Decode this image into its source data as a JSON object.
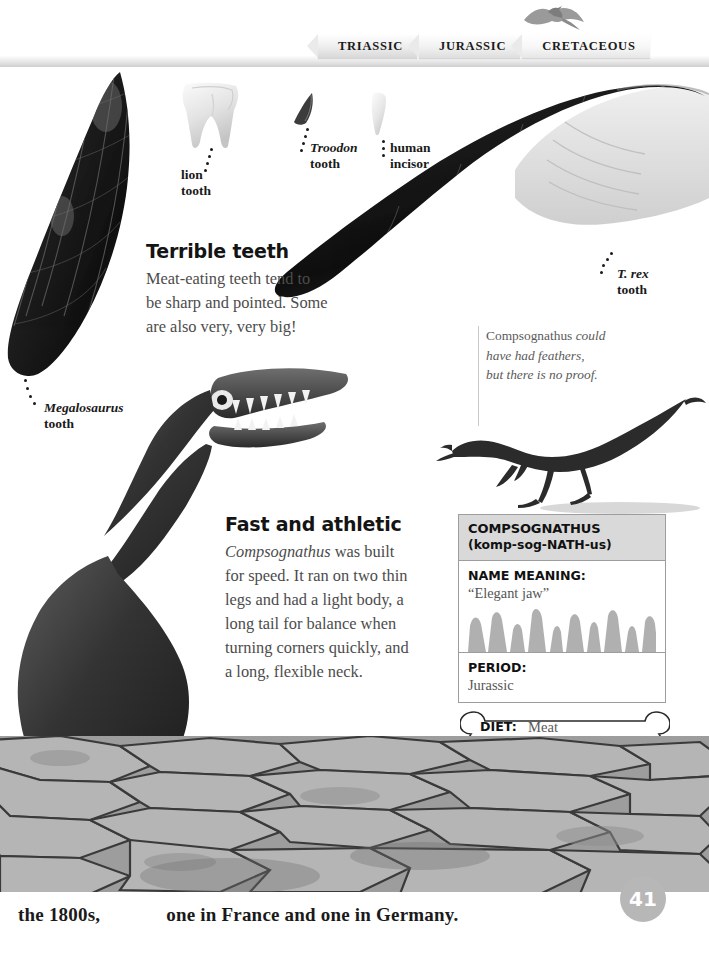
{
  "page": {
    "number": "41",
    "timeline": [
      {
        "label": "TRIASSIC"
      },
      {
        "label": "JURASSIC"
      },
      {
        "label": "CRETACEOUS"
      }
    ]
  },
  "specimen_labels": {
    "lion": "lion\ntooth",
    "lion_line1": "lion",
    "lion_line2": "tooth",
    "troodon_italic": "Troodon",
    "troodon_line2": "tooth",
    "human_line1": "human",
    "human_line2": "incisor",
    "trex_line1": "T. rex",
    "trex_line2": "tooth",
    "megalosaurus_italic": "Megalosaurus",
    "megalosaurus_line2": "tooth"
  },
  "terrible_teeth": {
    "heading": "Terrible teeth",
    "line1": "Meat-eating teeth tend to",
    "line2": "be sharp and pointed. Some",
    "line3": "are also very, very big!"
  },
  "feather_caption": {
    "roman": "Compsognathus",
    "rest1": " could",
    "line2": "have had feathers,",
    "line3": "but there is no proof."
  },
  "fast_athletic": {
    "heading": "Fast and athletic",
    "italic": "Compsognathus",
    "l1_rest": " was built",
    "line2": "for speed. It ran on two thin",
    "line3": "legs and had a light body, a",
    "line4": "long tail for balance when",
    "line5": "turning corners quickly, and",
    "line6": "a long, flexible neck."
  },
  "factbox": {
    "name": "COMPSOGNATHUS",
    "pronunciation": "(komp-sog-NATH-us)",
    "name_meaning_label": "NAME MEANING:",
    "name_meaning_value": "“Elegant jaw”",
    "period_label": "PERIOD:",
    "period_value": "Jurassic",
    "diet_label": "DIET:",
    "diet_value": "Meat"
  },
  "footer": {
    "text_left": "the 1800s,",
    "text_right": "one in France and one in Germany."
  },
  "colors": {
    "page_number_bg": "#b7b7b7",
    "factbox_header_bg": "#d9d9d9",
    "factbox_border": "#9d9d9d",
    "body_text": "#4c4c4c",
    "heading_text": "#141414",
    "teeth_gray": "#b0b0b0"
  }
}
